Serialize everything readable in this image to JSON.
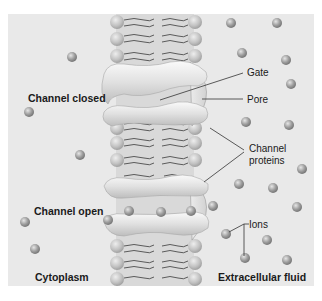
{
  "colors": {
    "page_background": "#ffffff",
    "panel_background": "#e9e9e9",
    "membrane_core": "#d6d6d6",
    "phospholipid_head": "#c4c4c4",
    "protein": "#e2e2e2",
    "ion": "#9a9a9a",
    "label_line": "#333333"
  },
  "regions": {
    "left": "Cytoplasm",
    "right": "Extracellular fluid"
  },
  "states": {
    "closed": "Channel closed",
    "open": "Channel open"
  },
  "callouts": {
    "gate": "Gate",
    "pore": "Pore",
    "channel_proteins_line1": "Channel",
    "channel_proteins_line2": "proteins",
    "ions": "Ions"
  }
}
